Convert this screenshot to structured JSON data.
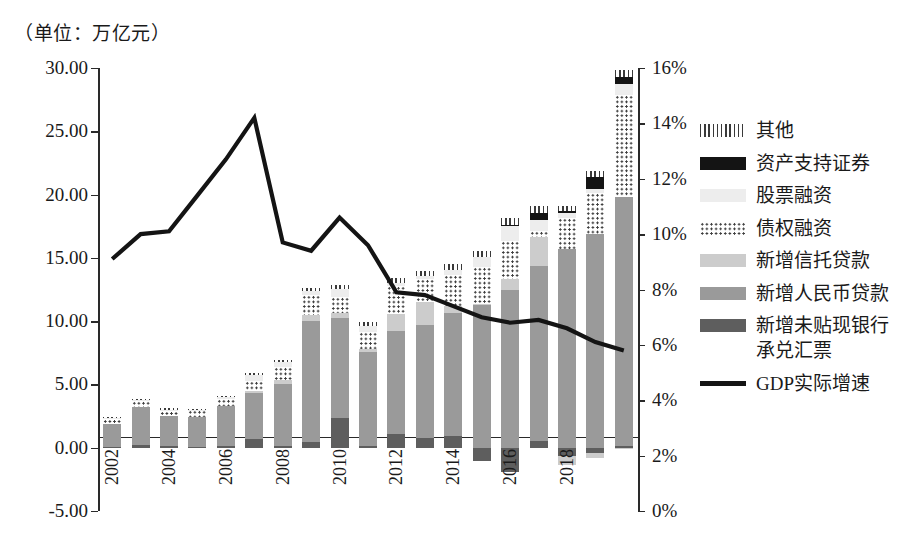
{
  "unit_label": "（单位：万亿元）",
  "left_axis": {
    "ticks": [
      "30.00",
      "25.00",
      "20.00",
      "15.00",
      "10.00",
      "5.00",
      "0.00",
      "-5.00"
    ],
    "min": -5,
    "max": 30,
    "step": 5
  },
  "right_axis": {
    "ticks": [
      "16%",
      "14%",
      "12%",
      "10%",
      "8%",
      "6%",
      "4%",
      "2%",
      "0%"
    ],
    "min": 0,
    "max": 16,
    "step": 2
  },
  "legend": {
    "items": [
      {
        "label": "其他",
        "key": "other",
        "swatch": "sw-other"
      },
      {
        "label": "资产支持证券",
        "key": "abs",
        "swatch": "sw-abs"
      },
      {
        "label": "股票融资",
        "key": "equity",
        "swatch": "sw-equity"
      },
      {
        "label": "债权融资",
        "key": "bond",
        "swatch": "sw-bond"
      },
      {
        "label": "新增信托贷款",
        "key": "trust",
        "swatch": "sw-trust"
      },
      {
        "label": "新增人民币贷款",
        "key": "loan",
        "swatch": "sw-loan"
      },
      {
        "label": "新增未贴现银行\n承兑汇票",
        "key": "accept",
        "swatch": "sw-accept"
      },
      {
        "label": "GDP实际增速",
        "key": "gdp",
        "swatch": "line-sw"
      }
    ]
  },
  "chart_data": {
    "type": "bar",
    "title": "",
    "xlabel": "",
    "ylabel": "万亿元",
    "y2label": "%",
    "ylim": [
      -5,
      30
    ],
    "y2lim": [
      0,
      16
    ],
    "grid": false,
    "legend_position": "right",
    "categories": [
      "2002",
      "2003",
      "2004",
      "2005",
      "2006",
      "2007",
      "2008",
      "2009",
      "2010",
      "2011",
      "2012",
      "2013",
      "2014",
      "2015",
      "2016",
      "2017",
      "2018",
      "2019",
      "2020"
    ],
    "tick_categories": [
      "2002",
      "2004",
      "2006",
      "2008",
      "2010",
      "2012",
      "2014",
      "2016",
      "2018"
    ],
    "series": [
      {
        "name": "新增未贴现银行承兑汇票",
        "key": "accept",
        "values": [
          0.06,
          0.2,
          0.1,
          0.02,
          0.15,
          0.67,
          0.11,
          0.46,
          2.33,
          0.1,
          1.05,
          0.78,
          0.89,
          -1.06,
          -1.95,
          0.54,
          -0.64,
          -0.44,
          0.17
        ]
      },
      {
        "name": "新增人民币贷款",
        "key": "loan",
        "values": [
          1.85,
          2.99,
          2.37,
          2.43,
          3.18,
          3.63,
          4.9,
          9.59,
          7.95,
          7.47,
          8.2,
          8.89,
          9.78,
          11.27,
          12.44,
          13.84,
          15.67,
          16.88,
          19.63
        ]
      },
      {
        "name": "新增信托贷款",
        "key": "trust",
        "values": [
          0,
          0,
          0,
          0,
          0,
          0.17,
          0.31,
          0.44,
          0.39,
          0.2,
          1.29,
          1.84,
          0.52,
          0.08,
          0.86,
          2.26,
          -0.69,
          -0.34,
          -0.11
        ]
      },
      {
        "name": "债权融资",
        "key": "bond",
        "values": [
          0.37,
          0.5,
          0.47,
          0.5,
          0.52,
          0.82,
          1.09,
          1.56,
          1.27,
          1.37,
          2.25,
          1.8,
          2.43,
          2.94,
          3.0,
          0.45,
          2.49,
          3.24,
          8.05
        ]
      },
      {
        "name": "股票融资",
        "key": "equity",
        "values": [
          0.06,
          0.06,
          0.07,
          0.03,
          0.15,
          0.43,
          0.33,
          0.34,
          0.58,
          0.44,
          0.25,
          0.22,
          0.43,
          0.76,
          1.24,
          0.87,
          0.36,
          0.35,
          0.89
        ]
      },
      {
        "name": "资产支持证券",
        "key": "abs",
        "values": [
          0,
          0,
          0,
          0,
          0,
          0,
          0,
          0,
          0,
          0,
          0,
          0,
          0,
          0,
          0.08,
          0.55,
          0.16,
          0.94,
          0.52
        ]
      },
      {
        "name": "其他",
        "key": "other",
        "values": [
          0.08,
          0.1,
          0.09,
          0.09,
          0.12,
          0.18,
          0.22,
          0.26,
          0.34,
          0.32,
          0.36,
          0.45,
          0.48,
          0.5,
          0.54,
          0.58,
          0.44,
          0.48,
          0.62
        ]
      }
    ],
    "line_series": {
      "name": "GDP实际增速",
      "axis": "right",
      "unit": "%",
      "values": [
        9.1,
        10.0,
        10.1,
        11.4,
        12.7,
        14.2,
        9.7,
        9.4,
        10.6,
        9.6,
        7.9,
        7.8,
        7.4,
        7.0,
        6.8,
        6.9,
        6.6,
        6.1,
        5.8
      ]
    }
  }
}
